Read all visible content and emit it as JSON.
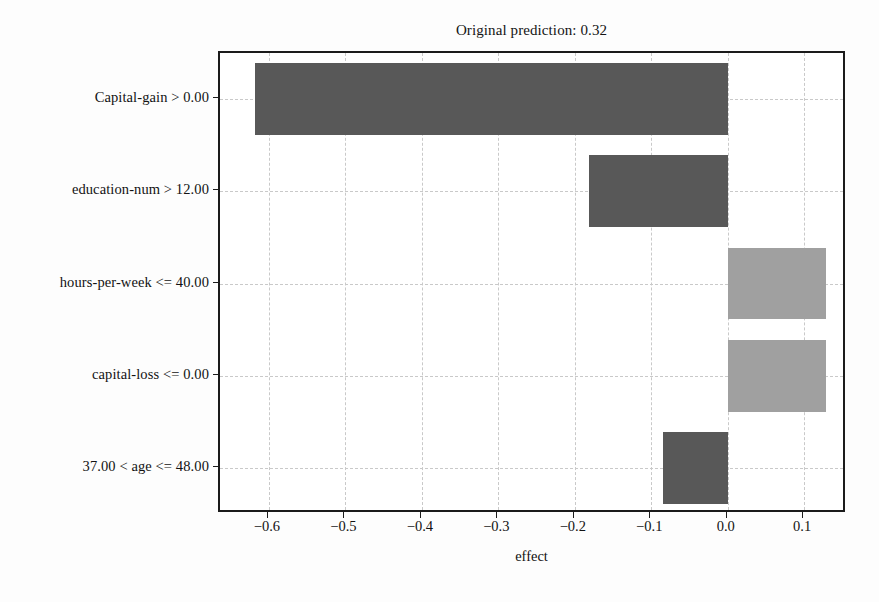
{
  "chart_data": {
    "type": "bar",
    "orientation": "horizontal",
    "title": "Original prediction: 0.32",
    "xlabel": "effect",
    "ylabel": "",
    "categories": [
      "Capital-gain > 0.00",
      "education-num > 12.00",
      "hours-per-week <= 40.00",
      "capital-loss <= 0.00",
      "37.00 < age <= 48.00"
    ],
    "values": [
      -0.618,
      -0.182,
      0.129,
      0.129,
      -0.084
    ],
    "xlim": [
      -0.664,
      0.156
    ],
    "ylim": [
      -0.5,
      4.5
    ],
    "xticks": [
      -0.6,
      -0.5,
      -0.4,
      -0.3,
      -0.2,
      -0.1,
      0.0,
      0.1
    ],
    "xticklabels": [
      "-0.6",
      "-0.5",
      "-0.4",
      "-0.3",
      "-0.2",
      "-0.1",
      "0.0",
      "0.1"
    ],
    "grid": true,
    "grid_style": "dashed",
    "legend": null,
    "bar_colors": [
      "#585858",
      "#585858",
      "#a0a0a0",
      "#a0a0a0",
      "#585858"
    ],
    "colors": {
      "negative_effect": "#585858",
      "positive_effect": "#a0a0a0",
      "axis": "#1b1b1b",
      "grid": "#c9c9c9",
      "text": "#121212",
      "background": "#ffffff"
    }
  }
}
